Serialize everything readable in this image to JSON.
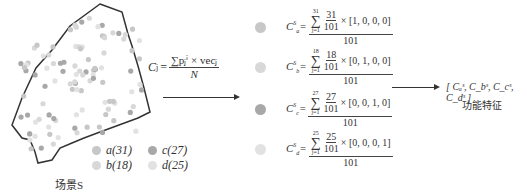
{
  "scene": {
    "label": "场景S",
    "legend": [
      {
        "key": "a",
        "text": "a(31)",
        "color": "#c7c7c7"
      },
      {
        "key": "b",
        "text": "b(18)",
        "color": "#d8d8d8"
      },
      {
        "key": "c",
        "text": "c(27)",
        "color": "#a8a8a8"
      },
      {
        "key": "d",
        "text": "d(25)",
        "color": "#e2e2e2"
      }
    ]
  },
  "formula": {
    "lhs": "C",
    "lhs_sub": "j",
    "eq": "=",
    "numerator": "∑pⱼⁱ × vecⱼ",
    "denominator": "N"
  },
  "rows": [
    {
      "label": "C",
      "sub": "a",
      "sup": "S",
      "sigma_top": "31",
      "sigma_bot": "j=1",
      "frac_n": "31",
      "frac_d": "101",
      "vec": "× [1, 0, 0, 0]",
      "den": "101",
      "color": "#c7c7c7"
    },
    {
      "label": "C",
      "sub": "b",
      "sup": "S",
      "sigma_top": "18",
      "sigma_bot": "j=1",
      "frac_n": "18",
      "frac_d": "101",
      "vec": "× [0, 1, 0, 0]",
      "den": "101",
      "color": "#d8d8d8"
    },
    {
      "label": "C",
      "sub": "c",
      "sup": "S",
      "sigma_top": "27",
      "sigma_bot": "j=1",
      "frac_n": "27",
      "frac_d": "101",
      "vec": "× [0, 0, 1, 0]",
      "den": "101",
      "color": "#a8a8a8"
    },
    {
      "label": "C",
      "sub": "d",
      "sup": "S",
      "sigma_top": "25",
      "sigma_bot": "j=1",
      "frac_n": "25",
      "frac_d": "101",
      "vec": "× [0, 0, 0, 1]",
      "den": "101",
      "color": "#e2e2e2"
    }
  ],
  "output": {
    "vector": "[ Cₐˢ, C_bˢ, C_cˢ, C_dˢ ]",
    "label": "功能特征"
  }
}
